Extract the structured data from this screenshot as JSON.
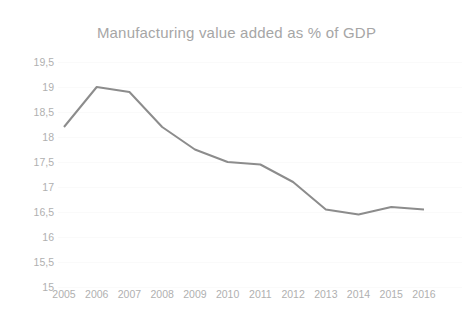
{
  "chart_data": {
    "type": "line",
    "title": "Manufacturing value added as % of GDP",
    "xlabel": "",
    "ylabel": "",
    "categories": [
      "2005",
      "2006",
      "2007",
      "2008",
      "2009",
      "2010",
      "2011",
      "2012",
      "2013",
      "2014",
      "2015",
      "2016"
    ],
    "values": [
      18.2,
      19.0,
      18.9,
      18.2,
      17.75,
      17.5,
      17.45,
      17.1,
      16.55,
      16.45,
      16.6,
      16.55
    ],
    "series": [
      {
        "name": "Manufacturing value added as % of GDP",
        "values": [
          18.2,
          19.0,
          18.9,
          18.2,
          17.75,
          17.5,
          17.45,
          17.1,
          16.55,
          16.45,
          16.6,
          16.55
        ]
      }
    ],
    "ylim": [
      15,
      19.5
    ],
    "yticks": [
      19.5,
      19,
      18.5,
      18,
      17.5,
      17,
      16.5,
      16,
      15.5,
      15
    ],
    "ytick_labels": [
      "19,5",
      "19",
      "18,5",
      "18",
      "17,5",
      "17",
      "16,5",
      "16",
      "15,5",
      "15"
    ],
    "xtick_labels": [
      "2005",
      "2006",
      "2007",
      "2008",
      "2009",
      "2010",
      "2011",
      "2012",
      "2013",
      "2014",
      "2015",
      "2016"
    ],
    "grid": true,
    "grid_axis": "y",
    "legend": false,
    "legend_position": "none",
    "line_color": "#8c8c8c",
    "grid_color": "#fafafa",
    "text_color": "#b0b0b0",
    "title_color": "#a6a6a6",
    "background_color": "#ffffff",
    "line_width": 2,
    "markers": false
  }
}
